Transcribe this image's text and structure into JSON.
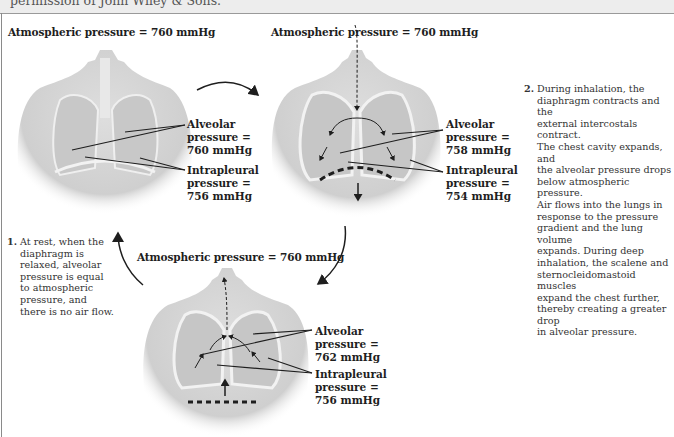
{
  "caption": {
    "text": "permission of John Wiley & Sons."
  },
  "panels": {
    "rest": {
      "atmospheric": "Atmospheric pressure = 760 mmHg",
      "alveolar": [
        "Alveolar",
        "pressure =",
        "760 mmHg"
      ],
      "intrapleural": [
        "Intrapleural",
        "pressure =",
        "756 mmHg"
      ],
      "description_number": "1.",
      "description": [
        "At rest, when the",
        "diaphragm is",
        "relaxed, alveolar",
        "pressure is equal",
        "to atmospheric",
        "pressure, and",
        "there is no air flow."
      ]
    },
    "inhalation": {
      "atmospheric": "Atmospheric pressure = 760 mmHg",
      "alveolar": [
        "Alveolar",
        "pressure =",
        "758 mmHg"
      ],
      "intrapleural": [
        "Intrapleural",
        "pressure =",
        "754 mmHg"
      ],
      "description_number": "2.",
      "description": [
        "During inhalation, the",
        "diaphragm contracts and the",
        "external intercostals contract.",
        "The chest cavity expands, and",
        "the alveolar pressure drops",
        "below atmospheric pressure.",
        "Air flows into the lungs in",
        "response to the pressure",
        "gradient and the lung volume",
        "expands. During deep",
        "inhalation, the scalene and",
        "sternocleidomastoid muscles",
        "expand the chest further,",
        "thereby creating a greater drop",
        "in alveolar pressure."
      ]
    },
    "exhalation": {
      "atmospheric": "Atmospheric pressure = 760 mmHg",
      "alveolar": [
        "Alveolar",
        "pressure =",
        "762 mmHg"
      ],
      "intrapleural": [
        "Intrapleural",
        "pressure =",
        "756 mmHg"
      ]
    }
  },
  "colors": {
    "body": "#d9d9d9",
    "body_shadow": "#bdbdbd",
    "lung": "#c4c4c4",
    "outline": "#f4f4f4",
    "arrow": "#1e1e1e"
  }
}
